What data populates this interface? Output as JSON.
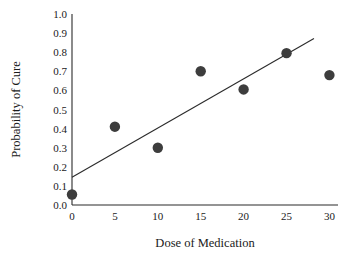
{
  "chart_data": {
    "type": "scatter",
    "title": "",
    "subtitle": "",
    "xlabel": "Dose of Medication",
    "ylabel": "Probability of Cure",
    "xlim": [
      0,
      31
    ],
    "ylim": [
      0,
      1.0
    ],
    "xticks": [
      0,
      5,
      10,
      15,
      20,
      25,
      30
    ],
    "xtick_labels": [
      "0",
      "5",
      "10",
      "15",
      "20",
      "25",
      "30"
    ],
    "yticks": [
      0.0,
      0.1,
      0.2,
      0.3,
      0.4,
      0.5,
      0.6,
      0.7,
      0.8,
      0.9,
      1.0
    ],
    "ytick_labels": [
      "0.0",
      "0.1",
      "0.2",
      "0.3",
      "0.4",
      "0.5",
      "0.6",
      "0.7",
      "0.8",
      "0.9",
      "1.0"
    ],
    "grid": false,
    "legend": "none",
    "annotations": [],
    "series": [
      {
        "name": "Observed probability of cure",
        "marker": "filled-circle",
        "marker_color": "#3d3d3d",
        "x": [
          0,
          5,
          10,
          15,
          20,
          25,
          30
        ],
        "y": [
          0.055,
          0.41,
          0.3,
          0.7,
          0.605,
          0.795,
          0.68
        ]
      }
    ],
    "trend_line": {
      "name": "Fitted regression line",
      "color": "#2b2b2b",
      "x_start": 0,
      "y_start": 0.145,
      "x_end": 28.2,
      "y_end": 0.872
    }
  }
}
